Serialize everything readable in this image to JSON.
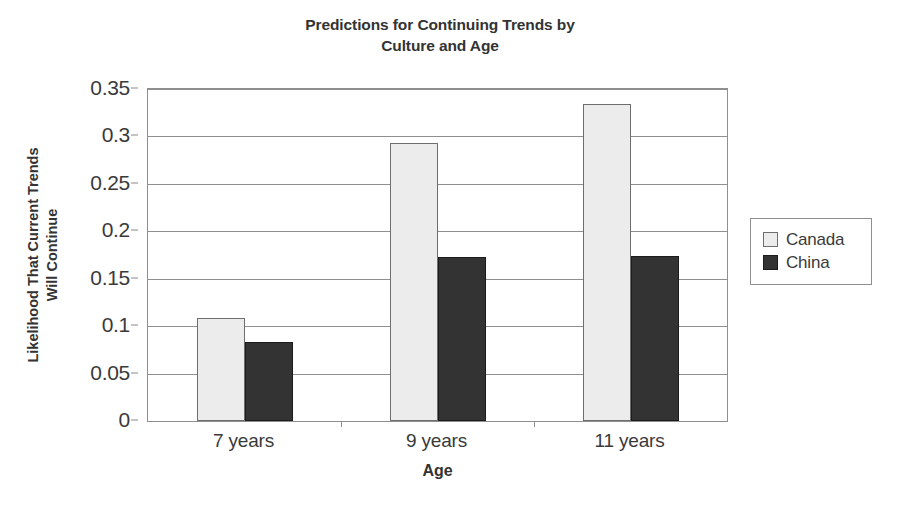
{
  "chart_data": {
    "type": "bar",
    "title": "Predictions for Continuing Trends by Culture and Age",
    "title_line1": "Predictions for Continuing Trends by",
    "title_line2": "Culture and Age",
    "xlabel": "Age",
    "ylabel": "Likelihood That Current Trends Will Continue",
    "ylabel_line1": "Likelihood That Current Trends",
    "ylabel_line2": "Will Continue",
    "categories": [
      "7 years",
      "9 years",
      "11 years"
    ],
    "series": [
      {
        "name": "Canada",
        "values": [
          0.109,
          0.293,
          0.334
        ],
        "color": "#ececec"
      },
      {
        "name": "China",
        "values": [
          0.083,
          0.173,
          0.174
        ],
        "color": "#333333"
      }
    ],
    "ylim": [
      0,
      0.35
    ],
    "yticks": [
      0,
      0.05,
      0.1,
      0.15,
      0.2,
      0.25,
      0.3,
      0.35
    ],
    "ytick_labels": [
      "0",
      "0.05",
      "0.1",
      "0.15",
      "0.2",
      "0.25",
      "0.3",
      "0.35"
    ],
    "grid": true,
    "legend_position": "right",
    "legend_entries": [
      "Canada",
      "China"
    ]
  }
}
